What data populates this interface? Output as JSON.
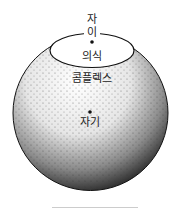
{
  "diagram": {
    "labels": {
      "ego_top": "자",
      "ego_bottom": "이",
      "consciousness": "의식",
      "complex": "콤플렉스",
      "self": "자기"
    },
    "colors": {
      "stroke": "#111111",
      "background": "#ffffff"
    }
  }
}
